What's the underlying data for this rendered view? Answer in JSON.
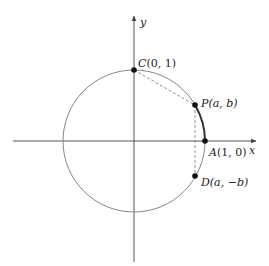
{
  "diagram": {
    "axes": {
      "x_label": "x",
      "y_label": "y"
    },
    "points": {
      "C": {
        "name": "C",
        "coords": "(0, 1)"
      },
      "P": {
        "name": "P",
        "coords": "(a, b)"
      },
      "A": {
        "name": "A",
        "coords": "(1, 0)"
      },
      "D": {
        "name": "D",
        "coords": "(a, −b)"
      }
    },
    "colors": {
      "line": "#555555",
      "point": "#111111",
      "arc": "#333333"
    }
  }
}
